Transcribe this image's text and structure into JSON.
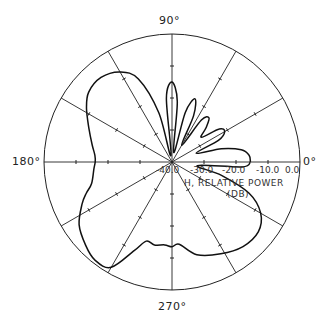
{
  "chart_data": {
    "type": "polar",
    "title": "",
    "angle_labels": [
      "90°",
      "180°",
      "270°",
      "0°"
    ],
    "radial_tick_labels": [
      "-40.0",
      "-30.0",
      "-20.0",
      "-10.0",
      "0.0"
    ],
    "radial_axis_label": "H, RELATIVE POWER",
    "radial_axis_unit": "(DB)",
    "rlim": [
      -40,
      0
    ],
    "spokes_deg": [
      0,
      30,
      60,
      90,
      120,
      150,
      180,
      210,
      240,
      270,
      300,
      330
    ],
    "grid": "spokes only, outer circle",
    "series": [
      {
        "name": "H-plane pattern",
        "points_deg_db": [
          [
            0,
            -15.5
          ],
          [
            5,
            -15.8
          ],
          [
            10,
            -18
          ],
          [
            15,
            -24
          ],
          [
            20,
            -32
          ],
          [
            25,
            -24
          ],
          [
            30,
            -21
          ],
          [
            35,
            -22
          ],
          [
            40,
            -28
          ],
          [
            45,
            -25
          ],
          [
            50,
            -22
          ],
          [
            55,
            -24
          ],
          [
            60,
            -34
          ],
          [
            65,
            -24
          ],
          [
            70,
            -19
          ],
          [
            75,
            -24
          ],
          [
            80,
            -37
          ],
          [
            85,
            -21
          ],
          [
            90,
            -15
          ],
          [
            95,
            -20
          ],
          [
            100,
            -38
          ],
          [
            105,
            -24
          ],
          [
            112,
            -12
          ],
          [
            120,
            -7.5
          ],
          [
            130,
            -5.5
          ],
          [
            140,
            -6
          ],
          [
            148,
            -8.5
          ],
          [
            158,
            -12
          ],
          [
            168,
            -14.5
          ],
          [
            175,
            -15.8
          ],
          [
            180,
            -16
          ],
          [
            185,
            -15.5
          ],
          [
            195,
            -14
          ],
          [
            200,
            -11.5
          ],
          [
            205,
            -9
          ],
          [
            214,
            -5
          ],
          [
            224,
            -2.5
          ],
          [
            232,
            -1
          ],
          [
            240,
            -2
          ],
          [
            247,
            -10
          ],
          [
            252,
            -14
          ],
          [
            258,
            -13.5
          ],
          [
            265,
            -14
          ],
          [
            270,
            -13.5
          ],
          [
            275,
            -14.2
          ],
          [
            285,
            -10
          ],
          [
            298,
            -7.5
          ],
          [
            310,
            -5.5
          ],
          [
            321,
            -5.3
          ],
          [
            330,
            -8
          ],
          [
            338,
            -14
          ],
          [
            345,
            -24
          ],
          [
            352,
            -32
          ],
          [
            356,
            -18
          ],
          [
            360,
            -15.5
          ]
        ]
      }
    ]
  }
}
